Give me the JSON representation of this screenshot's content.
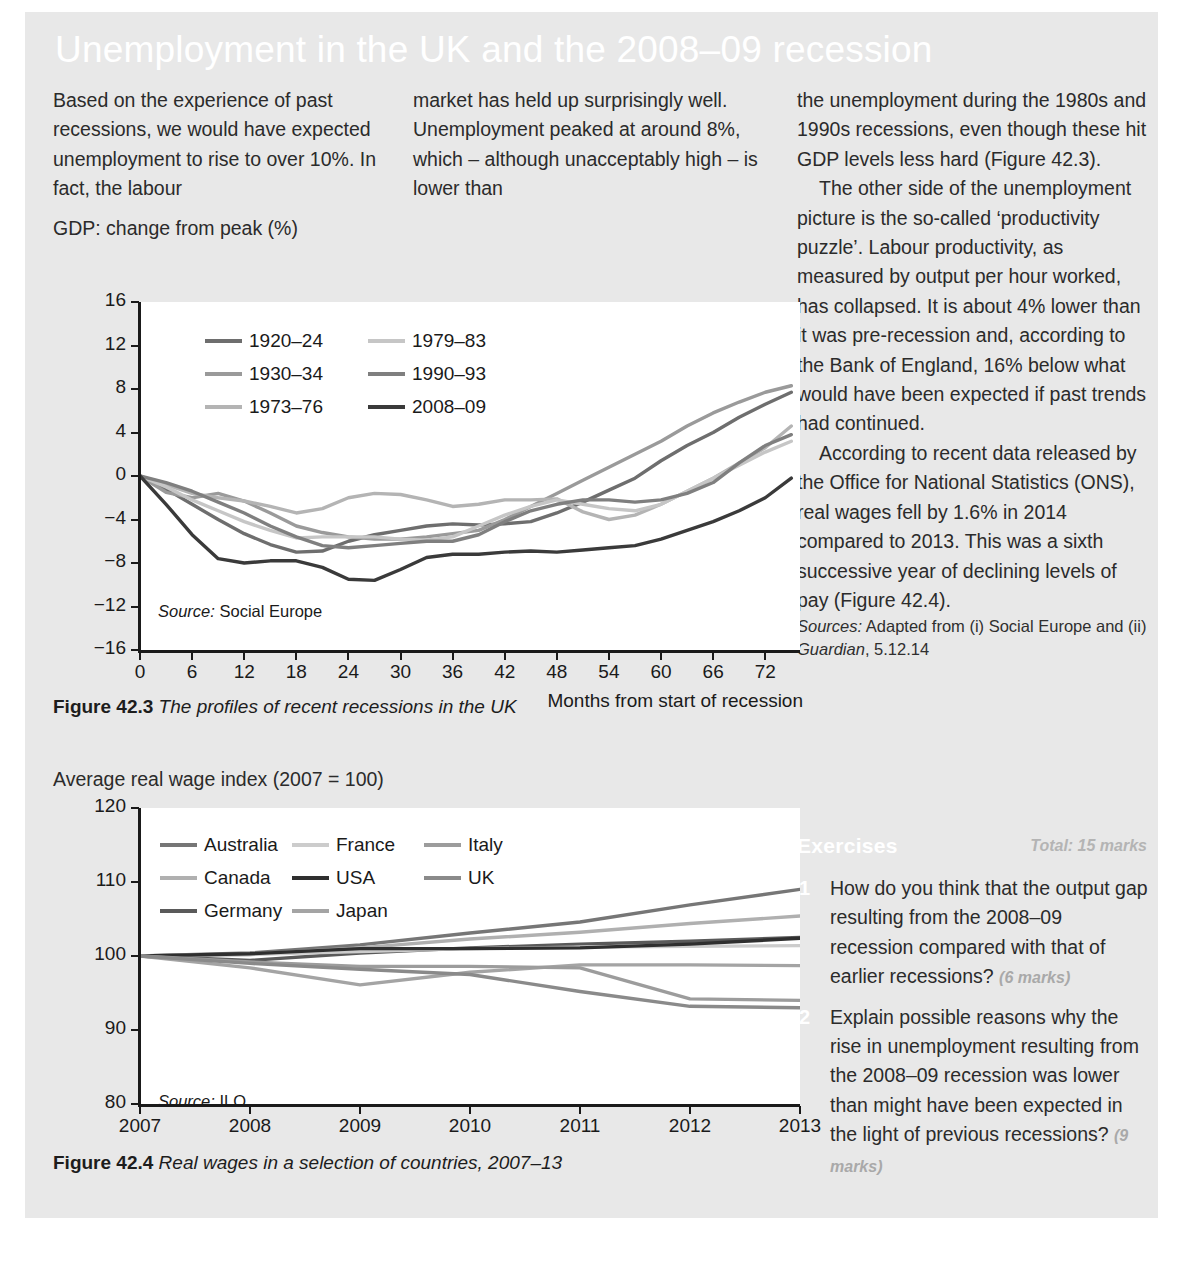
{
  "title": "Unemployment in the UK and the 2008–09 recession",
  "columns": {
    "a": "Based on the experience of past recessions, we would have expected unemployment to rise to over 10%. In fact, the labour",
    "b": "market has held up surprisingly well. Unemployment peaked at around 8%, which – although unacceptably high – is lower than",
    "c1": "the unemployment during the 1980s and 1990s recessions, even though these hit GDP levels less hard (Figure 42.3).",
    "c2": "The other side of the unemployment picture is the so-called ‘productivity puzzle’. Labour productivity, as measured by output per hour worked, has collapsed. It is about 4% lower than it was pre-recession and, according to the Bank of England, 16% below what would have been expected if past trends had continued.",
    "c3": "According to recent data released by the Office for National Statistics (ONS), real wages fell by 1.6% in 2014 compared to 2013. This was a sixth successive year of declining levels of pay (Figure 42.4).",
    "sources_label": "Sources:",
    "sources_text": " Adapted from (i) Social Europe and (ii) ",
    "sources_em": "Guardian",
    "sources_tail": ", 5.12.14"
  },
  "exercises": {
    "heading": "Exercises",
    "total": "Total: 15 marks",
    "items": [
      {
        "num": "1",
        "text": "How do you think that the output gap resulting from the 2008–09 recession compared with that of earlier recessions?",
        "marks": "(6 marks)"
      },
      {
        "num": "2",
        "text": "Explain possible reasons why the rise in unemployment resulting from the 2008–09 recession was lower than might have been expected in the light of previous recessions?",
        "marks": "(9 marks)"
      }
    ]
  },
  "figure_1": {
    "caption_label": "Figure 42.3",
    "caption_text": "The profiles of recent recessions in the UK",
    "source": "Source:",
    "source_text": " Social Europe"
  },
  "figure_2": {
    "caption_label": "Figure 42.4",
    "caption_text": "Real wages in a selection of countries, 2007–13",
    "source": "Source:",
    "source_text": " ILO"
  },
  "chart_data": [
    {
      "id": "fig423",
      "type": "line",
      "title": "GDP: change from peak (%)",
      "ylabel": "GDP: change from peak (%)",
      "xlabel": "Months from start of recession",
      "xlim": [
        0,
        76
      ],
      "ylim": [
        -16,
        16
      ],
      "xticks": [
        0,
        6,
        12,
        18,
        24,
        30,
        36,
        42,
        48,
        54,
        60,
        66,
        72
      ],
      "yticks": [
        -16,
        -12,
        -8,
        -4,
        0,
        4,
        8,
        12,
        16
      ],
      "grid": false,
      "legend_position": "top-left-inside",
      "source": "Source: Social Europe",
      "series": [
        {
          "name": "1920–24",
          "color": "#6e6e6e",
          "x": [
            0,
            3,
            6,
            9,
            12,
            15,
            18,
            21,
            24,
            27,
            30,
            33,
            36,
            39,
            42,
            45,
            48,
            51,
            54,
            57,
            60,
            63,
            66,
            69,
            72,
            75
          ],
          "values": [
            0,
            -1.2,
            -2.6,
            -4.0,
            -5.3,
            -6.3,
            -7.0,
            -6.9,
            -6.0,
            -5.4,
            -5.0,
            -4.6,
            -4.4,
            -4.5,
            -4.4,
            -4.2,
            -3.4,
            -2.4,
            -1.3,
            -0.2,
            1.4,
            2.8,
            4.0,
            5.4,
            6.6,
            7.7
          ]
        },
        {
          "name": "1930–34",
          "color": "#9a9a9a",
          "x": [
            0,
            3,
            6,
            9,
            12,
            15,
            18,
            21,
            24,
            27,
            30,
            33,
            36,
            39,
            42,
            45,
            48,
            51,
            54,
            57,
            60,
            63,
            66,
            69,
            72,
            75
          ],
          "values": [
            0,
            -1.5,
            -2.0,
            -1.6,
            -2.3,
            -3.4,
            -4.6,
            -5.2,
            -5.6,
            -5.8,
            -5.8,
            -5.6,
            -5.3,
            -5.0,
            -4.0,
            -2.8,
            -1.6,
            -0.4,
            0.8,
            2.0,
            3.2,
            4.6,
            5.8,
            6.8,
            7.7,
            8.3
          ]
        },
        {
          "name": "1973–76",
          "color": "#b4b4b4",
          "x": [
            0,
            3,
            6,
            9,
            12,
            15,
            18,
            21,
            24,
            27,
            30,
            33,
            36,
            39,
            42,
            45,
            48,
            51,
            54,
            57,
            60,
            63,
            66,
            69,
            72,
            75
          ],
          "values": [
            0,
            -0.8,
            -1.6,
            -2.0,
            -2.3,
            -2.8,
            -3.4,
            -3.0,
            -2.0,
            -1.6,
            -1.7,
            -2.2,
            -2.8,
            -2.6,
            -2.2,
            -2.2,
            -2.1,
            -3.3,
            -4.0,
            -3.6,
            -2.6,
            -1.4,
            -0.2,
            1.2,
            2.6,
            4.6
          ]
        },
        {
          "name": "1979–83",
          "color": "#c6c6c6",
          "x": [
            0,
            3,
            6,
            9,
            12,
            15,
            18,
            21,
            24,
            27,
            30,
            33,
            36,
            39,
            42,
            45,
            48,
            51,
            54,
            57,
            60,
            63,
            66,
            69,
            72,
            75
          ],
          "values": [
            0,
            -1.0,
            -2.2,
            -3.2,
            -4.2,
            -5.0,
            -5.7,
            -5.6,
            -5.6,
            -5.6,
            -5.8,
            -5.9,
            -5.6,
            -4.6,
            -3.6,
            -2.8,
            -2.2,
            -2.6,
            -3.0,
            -3.2,
            -2.6,
            -1.4,
            -0.2,
            1.0,
            2.2,
            3.2
          ]
        },
        {
          "name": "1990–93",
          "color": "#7f7f7f",
          "x": [
            0,
            3,
            6,
            9,
            12,
            15,
            18,
            21,
            24,
            27,
            30,
            33,
            36,
            39,
            42,
            45,
            48,
            51,
            54,
            57,
            60,
            63,
            66,
            69,
            72,
            75
          ],
          "values": [
            0,
            -0.6,
            -1.4,
            -2.4,
            -3.4,
            -4.6,
            -5.6,
            -6.4,
            -6.6,
            -6.4,
            -6.2,
            -6.0,
            -6.0,
            -5.4,
            -4.2,
            -3.2,
            -2.6,
            -2.2,
            -2.2,
            -2.4,
            -2.2,
            -1.6,
            -0.6,
            1.2,
            2.8,
            3.8
          ]
        },
        {
          "name": "2008–09",
          "color": "#3a3a3a",
          "x": [
            0,
            3,
            6,
            9,
            12,
            15,
            18,
            21,
            24,
            27,
            30,
            33,
            36,
            39,
            42,
            45,
            48,
            51,
            54,
            57,
            60,
            63,
            66,
            69,
            72,
            75
          ],
          "values": [
            0,
            -2.6,
            -5.4,
            -7.6,
            -8.0,
            -7.8,
            -7.8,
            -8.4,
            -9.5,
            -9.6,
            -8.6,
            -7.5,
            -7.2,
            -7.2,
            -7.0,
            -6.9,
            -7.0,
            -6.8,
            -6.6,
            -6.4,
            -5.8,
            -5.0,
            -4.2,
            -3.2,
            -2.0,
            -0.2
          ]
        }
      ]
    },
    {
      "id": "fig424",
      "type": "line",
      "title": "Average real wage index (2007 = 100)",
      "ylabel": "Average real wage index (2007 = 100)",
      "xlabel": "",
      "xlim": [
        2007,
        2013
      ],
      "ylim": [
        80,
        120
      ],
      "xticks": [
        2007,
        2008,
        2009,
        2010,
        2011,
        2012,
        2013
      ],
      "yticks": [
        80,
        90,
        100,
        110,
        120
      ],
      "grid": false,
      "legend_position": "top-left-inside",
      "source": "Source: ILO",
      "categories": [
        2007,
        2008,
        2009,
        2010,
        2011,
        2012,
        2013
      ],
      "series": [
        {
          "name": "Australia",
          "color": "#767676",
          "values": [
            100.0,
            100.4,
            101.5,
            103.1,
            104.6,
            106.9,
            109.0
          ]
        },
        {
          "name": "Canada",
          "color": "#b0b0b0",
          "values": [
            100.0,
            100.2,
            101.1,
            102.3,
            103.2,
            104.4,
            105.4
          ]
        },
        {
          "name": "Germany",
          "color": "#5a5a5a",
          "values": [
            100.0,
            99.4,
            100.4,
            101.1,
            101.6,
            102.0,
            102.5
          ]
        },
        {
          "name": "France",
          "color": "#cccccc",
          "values": [
            100.0,
            100.2,
            100.6,
            101.0,
            101.2,
            101.3,
            101.4
          ]
        },
        {
          "name": "USA",
          "color": "#2f2f2f",
          "values": [
            100.0,
            100.3,
            101.0,
            101.0,
            101.1,
            101.6,
            102.4
          ]
        },
        {
          "name": "Japan",
          "color": "#a4a4a4",
          "values": [
            100.0,
            98.4,
            96.1,
            97.8,
            98.8,
            98.8,
            98.7
          ]
        },
        {
          "name": "Italy",
          "color": "#9c9c9c",
          "values": [
            100.0,
            99.2,
            98.6,
            98.6,
            98.4,
            94.2,
            94.0
          ]
        },
        {
          "name": "UK",
          "color": "#8a8a8a",
          "values": [
            100.0,
            99.0,
            98.2,
            97.5,
            95.2,
            93.2,
            93.0
          ]
        }
      ]
    }
  ]
}
